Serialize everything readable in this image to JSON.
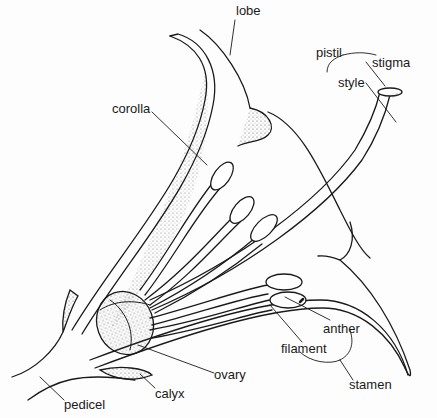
{
  "diagram": {
    "stroke_color": "#1a1a1a",
    "stipple_color": "#555555",
    "background": "#fdfdfd",
    "labels": [
      {
        "id": "lobe",
        "text": "lobe",
        "x": 236,
        "y": 14
      },
      {
        "id": "pistil",
        "text": "pistil",
        "x": 316,
        "y": 47
      },
      {
        "id": "stigma",
        "text": "stigma",
        "x": 372,
        "y": 57
      },
      {
        "id": "style",
        "text": "style",
        "x": 340,
        "y": 76
      },
      {
        "id": "corolla",
        "text": "corolla",
        "x": 112,
        "y": 102
      },
      {
        "id": "anther",
        "text": "anther",
        "x": 323,
        "y": 320
      },
      {
        "id": "filament",
        "text": "filament",
        "x": 281,
        "y": 340
      },
      {
        "id": "ovary",
        "text": "ovary",
        "x": 214,
        "y": 367
      },
      {
        "id": "stamen",
        "text": "stamen",
        "x": 349,
        "y": 376
      },
      {
        "id": "calyx",
        "text": "calyx",
        "x": 155,
        "y": 386
      },
      {
        "id": "pedicel",
        "text": "pedicel",
        "x": 64,
        "y": 396
      }
    ]
  }
}
